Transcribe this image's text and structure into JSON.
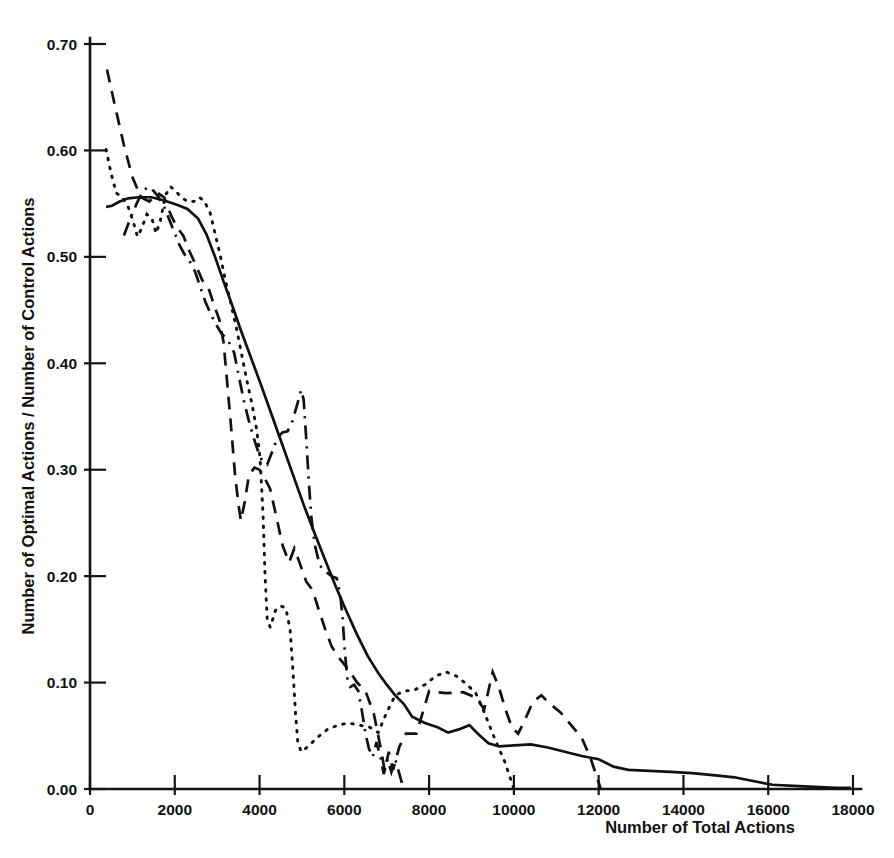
{
  "chart_data": {
    "type": "line",
    "title": "",
    "xlabel": "Number of Total Actions",
    "ylabel": "Number of Optimal Actions / Number of Control Actions",
    "xlim": [
      0,
      18000
    ],
    "ylim": [
      0.0,
      0.7
    ],
    "grid": false,
    "legend": "none",
    "xticks": [
      0,
      2000,
      4000,
      6000,
      8000,
      10000,
      12000,
      14000,
      16000,
      18000
    ],
    "xtick_labels": [
      "0",
      "2000",
      "4000",
      "6000",
      "8000",
      "10000",
      "12000",
      "14000",
      "16000",
      "18000"
    ],
    "yticks": [
      0.0,
      0.1,
      0.2,
      0.3,
      0.4,
      0.5,
      0.6,
      0.7
    ],
    "ytick_labels": [
      "0.00",
      "0.10",
      "0.20",
      "0.30",
      "0.40",
      "0.50",
      "0.60",
      "0.70"
    ],
    "series": [
      {
        "name": "solid-curve",
        "style": "solid",
        "points": [
          [
            380,
            0.547
          ],
          [
            520,
            0.548
          ],
          [
            700,
            0.552
          ],
          [
            900,
            0.555
          ],
          [
            1150,
            0.556
          ],
          [
            1450,
            0.556
          ],
          [
            1750,
            0.553
          ],
          [
            2050,
            0.549
          ],
          [
            2300,
            0.545
          ],
          [
            2550,
            0.536
          ],
          [
            2750,
            0.521
          ],
          [
            2950,
            0.5
          ],
          [
            3150,
            0.477
          ],
          [
            3350,
            0.455
          ],
          [
            3550,
            0.432
          ],
          [
            3800,
            0.405
          ],
          [
            4050,
            0.378
          ],
          [
            4300,
            0.35
          ],
          [
            4550,
            0.322
          ],
          [
            4800,
            0.294
          ],
          [
            5050,
            0.266
          ],
          [
            5300,
            0.24
          ],
          [
            5550,
            0.215
          ],
          [
            5800,
            0.19
          ],
          [
            6050,
            0.167
          ],
          [
            6300,
            0.145
          ],
          [
            6550,
            0.125
          ],
          [
            6800,
            0.109
          ],
          [
            7000,
            0.098
          ],
          [
            7200,
            0.088
          ],
          [
            7400,
            0.08
          ],
          [
            7600,
            0.068
          ],
          [
            7900,
            0.062
          ],
          [
            8200,
            0.058
          ],
          [
            8450,
            0.053
          ],
          [
            8700,
            0.056
          ],
          [
            8950,
            0.06
          ],
          [
            9150,
            0.052
          ],
          [
            9400,
            0.043
          ],
          [
            9650,
            0.04
          ],
          [
            10000,
            0.041
          ],
          [
            10400,
            0.042
          ],
          [
            10800,
            0.039
          ],
          [
            11200,
            0.035
          ],
          [
            11600,
            0.031
          ],
          [
            12000,
            0.028
          ],
          [
            12350,
            0.021
          ],
          [
            12700,
            0.018
          ],
          [
            13200,
            0.017
          ],
          [
            13700,
            0.016
          ],
          [
            14200,
            0.015
          ],
          [
            14700,
            0.013
          ],
          [
            15200,
            0.011
          ],
          [
            15700,
            0.007
          ],
          [
            16100,
            0.004
          ],
          [
            16600,
            0.003
          ],
          [
            17100,
            0.002
          ],
          [
            17600,
            0.001
          ],
          [
            17950,
            0.001
          ]
        ]
      },
      {
        "name": "dashed-curve",
        "style": "dashed",
        "points": [
          [
            400,
            0.676
          ],
          [
            600,
            0.64
          ],
          [
            800,
            0.605
          ],
          [
            1000,
            0.575
          ],
          [
            1200,
            0.556
          ],
          [
            1400,
            0.552
          ],
          [
            1600,
            0.56
          ],
          [
            1750,
            0.556
          ],
          [
            1900,
            0.54
          ],
          [
            2050,
            0.528
          ],
          [
            2200,
            0.52
          ],
          [
            2350,
            0.505
          ],
          [
            2500,
            0.492
          ],
          [
            2650,
            0.478
          ],
          [
            2800,
            0.47
          ],
          [
            2950,
            0.452
          ],
          [
            3050,
            0.441
          ],
          [
            3150,
            0.42
          ],
          [
            3250,
            0.376
          ],
          [
            3350,
            0.33
          ],
          [
            3420,
            0.296
          ],
          [
            3500,
            0.268
          ],
          [
            3560,
            0.252
          ],
          [
            3650,
            0.27
          ],
          [
            3750,
            0.295
          ],
          [
            3880,
            0.302
          ],
          [
            4000,
            0.3
          ],
          [
            4120,
            0.292
          ],
          [
            4250,
            0.282
          ],
          [
            4400,
            0.255
          ],
          [
            4550,
            0.228
          ],
          [
            4700,
            0.213
          ],
          [
            4820,
            0.226
          ],
          [
            4950,
            0.212
          ],
          [
            5100,
            0.195
          ],
          [
            5250,
            0.187
          ],
          [
            5400,
            0.168
          ],
          [
            5550,
            0.15
          ],
          [
            5700,
            0.134
          ],
          [
            5900,
            0.122
          ],
          [
            6100,
            0.112
          ],
          [
            6300,
            0.1
          ],
          [
            6500,
            0.092
          ],
          [
            6700,
            0.07
          ],
          [
            6850,
            0.04
          ],
          [
            6950,
            0.018
          ],
          [
            7050,
            0.035
          ],
          [
            7150,
            0.018
          ],
          [
            7300,
            0.04
          ],
          [
            7450,
            0.052
          ],
          [
            7700,
            0.052
          ],
          [
            8000,
            0.092
          ],
          [
            8400,
            0.09
          ],
          [
            8800,
            0.091
          ],
          [
            9100,
            0.086
          ],
          [
            9300,
            0.075
          ],
          [
            9500,
            0.11
          ],
          [
            9650,
            0.095
          ],
          [
            9800,
            0.075
          ],
          [
            9950,
            0.058
          ],
          [
            10100,
            0.052
          ],
          [
            10250,
            0.064
          ],
          [
            10450,
            0.082
          ],
          [
            10650,
            0.088
          ],
          [
            10850,
            0.08
          ],
          [
            11100,
            0.072
          ],
          [
            11350,
            0.06
          ],
          [
            11600,
            0.048
          ],
          [
            11800,
            0.03
          ],
          [
            11950,
            0.012
          ],
          [
            12050,
            0.0
          ]
        ]
      },
      {
        "name": "dotted-curve",
        "style": "dotted",
        "points": [
          [
            380,
            0.601
          ],
          [
            500,
            0.578
          ],
          [
            620,
            0.56
          ],
          [
            760,
            0.556
          ],
          [
            900,
            0.547
          ],
          [
            1020,
            0.533
          ],
          [
            1120,
            0.519
          ],
          [
            1220,
            0.527
          ],
          [
            1340,
            0.54
          ],
          [
            1460,
            0.536
          ],
          [
            1560,
            0.522
          ],
          [
            1660,
            0.534
          ],
          [
            1780,
            0.558
          ],
          [
            1900,
            0.566
          ],
          [
            2020,
            0.562
          ],
          [
            2150,
            0.556
          ],
          [
            2300,
            0.552
          ],
          [
            2450,
            0.552
          ],
          [
            2580,
            0.556
          ],
          [
            2700,
            0.552
          ],
          [
            2830,
            0.542
          ],
          [
            2950,
            0.522
          ],
          [
            3080,
            0.5
          ],
          [
            3200,
            0.477
          ],
          [
            3330,
            0.455
          ],
          [
            3460,
            0.432
          ],
          [
            3580,
            0.408
          ],
          [
            3700,
            0.384
          ],
          [
            3820,
            0.362
          ],
          [
            3930,
            0.338
          ],
          [
            4010,
            0.312
          ],
          [
            4080,
            0.26
          ],
          [
            4130,
            0.2
          ],
          [
            4180,
            0.16
          ],
          [
            4250,
            0.152
          ],
          [
            4380,
            0.168
          ],
          [
            4500,
            0.172
          ],
          [
            4620,
            0.17
          ],
          [
            4720,
            0.15
          ],
          [
            4790,
            0.11
          ],
          [
            4850,
            0.07
          ],
          [
            4900,
            0.045
          ],
          [
            4980,
            0.035
          ],
          [
            5150,
            0.04
          ],
          [
            5350,
            0.048
          ],
          [
            5600,
            0.056
          ],
          [
            5850,
            0.06
          ],
          [
            6100,
            0.062
          ],
          [
            6350,
            0.06
          ],
          [
            6600,
            0.058
          ],
          [
            6800,
            0.053
          ],
          [
            7000,
            0.072
          ],
          [
            7200,
            0.088
          ],
          [
            7400,
            0.092
          ],
          [
            7650,
            0.093
          ],
          [
            7900,
            0.098
          ],
          [
            8150,
            0.106
          ],
          [
            8400,
            0.11
          ],
          [
            8650,
            0.106
          ],
          [
            8900,
            0.098
          ],
          [
            9100,
            0.09
          ],
          [
            9250,
            0.077
          ],
          [
            9400,
            0.062
          ],
          [
            9520,
            0.05
          ],
          [
            9650,
            0.038
          ],
          [
            9780,
            0.026
          ],
          [
            9900,
            0.012
          ],
          [
            10000,
            0.0
          ]
        ]
      },
      {
        "name": "dashdot-curve",
        "style": "dashdot",
        "points": [
          [
            800,
            0.52
          ],
          [
            950,
            0.536
          ],
          [
            1100,
            0.55
          ],
          [
            1250,
            0.562
          ],
          [
            1380,
            0.566
          ],
          [
            1500,
            0.562
          ],
          [
            1620,
            0.556
          ],
          [
            1740,
            0.548
          ],
          [
            1860,
            0.536
          ],
          [
            1980,
            0.524
          ],
          [
            2100,
            0.512
          ],
          [
            2220,
            0.503
          ],
          [
            2350,
            0.496
          ],
          [
            2480,
            0.486
          ],
          [
            2600,
            0.472
          ],
          [
            2720,
            0.458
          ],
          [
            2850,
            0.446
          ],
          [
            2980,
            0.436
          ],
          [
            3100,
            0.428
          ],
          [
            3250,
            0.422
          ],
          [
            3400,
            0.41
          ],
          [
            3520,
            0.386
          ],
          [
            3640,
            0.363
          ],
          [
            3760,
            0.344
          ],
          [
            3860,
            0.33
          ],
          [
            3960,
            0.318
          ],
          [
            4060,
            0.308
          ],
          [
            4180,
            0.305
          ],
          [
            4300,
            0.317
          ],
          [
            4420,
            0.33
          ],
          [
            4540,
            0.335
          ],
          [
            4660,
            0.336
          ],
          [
            4780,
            0.346
          ],
          [
            4900,
            0.363
          ],
          [
            4980,
            0.375
          ],
          [
            5040,
            0.366
          ],
          [
            5100,
            0.33
          ],
          [
            5160,
            0.29
          ],
          [
            5220,
            0.256
          ],
          [
            5300,
            0.23
          ],
          [
            5420,
            0.21
          ],
          [
            5560,
            0.204
          ],
          [
            5700,
            0.2
          ],
          [
            5820,
            0.198
          ],
          [
            5900,
            0.184
          ],
          [
            5960,
            0.16
          ],
          [
            6010,
            0.13
          ],
          [
            6070,
            0.104
          ],
          [
            6140,
            0.096
          ],
          [
            6230,
            0.098
          ],
          [
            6330,
            0.092
          ],
          [
            6420,
            0.072
          ],
          [
            6500,
            0.052
          ],
          [
            6580,
            0.038
          ],
          [
            6670,
            0.03
          ],
          [
            6760,
            0.044
          ],
          [
            6850,
            0.03
          ],
          [
            6930,
            0.014
          ],
          [
            7020,
            0.028
          ],
          [
            7110,
            0.016
          ],
          [
            7200,
            0.028
          ],
          [
            7300,
            0.014
          ],
          [
            7400,
            0.0
          ]
        ]
      }
    ]
  },
  "axes": {
    "y_title": "Number of Optimal Actions / Number of Control Actions",
    "x_title": "Number of Total Actions"
  }
}
